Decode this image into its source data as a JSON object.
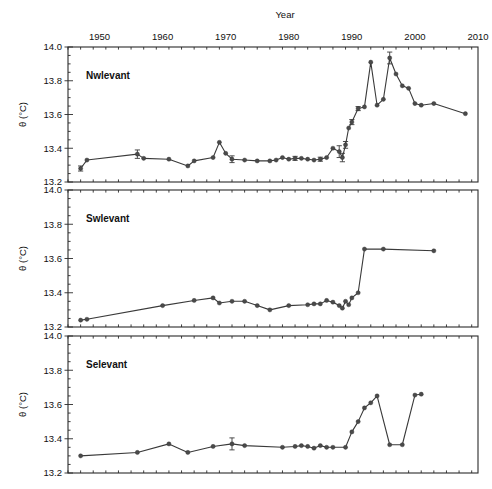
{
  "figure": {
    "title_top": "Year",
    "y_axis_label": "θ (°C)",
    "degree_unit": "°C",
    "background_color": "#ffffff",
    "line_color": "#3a3a3a",
    "marker_color": "#4a4a4a",
    "axis_color": "#2b2b2b"
  },
  "x_axis": {
    "label": "Year",
    "position": "top",
    "min": 1945,
    "max": 2010,
    "major_ticks": [
      1950,
      1960,
      1970,
      1980,
      1990,
      2000,
      2010
    ],
    "tick_labels": [
      "1950",
      "1960",
      "1970",
      "1980",
      "1990",
      "2000",
      "2010"
    ],
    "minor_tick_step": 2
  },
  "y_axis": {
    "label": "θ (°C)",
    "min": 13.2,
    "max": 14.0,
    "major_ticks": [
      13.2,
      13.4,
      13.6,
      13.8,
      14.0
    ],
    "tick_labels": [
      "13.2",
      "13.4",
      "13.6",
      "13.8",
      "14.0"
    ],
    "minor_tick_step": 0.05
  },
  "chart_data": {
    "type": "line",
    "title": "Year",
    "xlabel": "Year",
    "ylabel": "θ (°C)",
    "xlim": [
      1945,
      2010
    ],
    "ylim": [
      13.2,
      14.0
    ],
    "grid": false,
    "legend": "none",
    "panels": [
      {
        "label": "Nwlevant",
        "ylabel": "θ (°C)",
        "ylim": [
          13.2,
          14.0
        ],
        "yticks": [
          13.2,
          13.4,
          13.6,
          13.8,
          14.0
        ],
        "x": [
          1947,
          1948,
          1956,
          1957,
          1961,
          1964,
          1965,
          1968,
          1969,
          1970,
          1971,
          1973,
          1975,
          1977,
          1978,
          1979,
          1980,
          1981,
          1982,
          1983,
          1984,
          1985,
          1986,
          1987,
          1988,
          1988.5,
          1989,
          1989.5,
          1990,
          1991,
          1992,
          1993,
          1994,
          1995,
          1996,
          1997,
          1998,
          1999,
          2000,
          2001,
          2003,
          2008
        ],
        "y": [
          13.28,
          13.33,
          13.365,
          13.34,
          13.335,
          13.295,
          13.325,
          13.345,
          13.435,
          13.37,
          13.335,
          13.33,
          13.325,
          13.325,
          13.33,
          13.345,
          13.335,
          13.34,
          13.34,
          13.335,
          13.33,
          13.335,
          13.345,
          13.4,
          13.38,
          13.345,
          13.42,
          13.52,
          13.555,
          13.635,
          13.645,
          13.91,
          13.655,
          13.69,
          13.935,
          13.84,
          13.77,
          13.755,
          13.665,
          13.655,
          13.665,
          13.605
        ],
        "errors": [
          {
            "x": 1947,
            "y": 13.28,
            "err": 0.015
          },
          {
            "x": 1956,
            "y": 13.365,
            "err": 0.025
          },
          {
            "x": 1971,
            "y": 13.335,
            "err": 0.02
          },
          {
            "x": 1981,
            "y": 13.34,
            "err": 0.012
          },
          {
            "x": 1985,
            "y": 13.335,
            "err": 0.012
          },
          {
            "x": 1988,
            "y": 13.38,
            "err": 0.035
          },
          {
            "x": 1988.5,
            "y": 13.345,
            "err": 0.025
          },
          {
            "x": 1989,
            "y": 13.42,
            "err": 0.02
          },
          {
            "x": 1990,
            "y": 13.555,
            "err": 0.015
          },
          {
            "x": 1991,
            "y": 13.635,
            "err": 0.012
          },
          {
            "x": 1996,
            "y": 13.935,
            "err": 0.035
          }
        ]
      },
      {
        "label": "Swlevant",
        "ylabel": "θ (°C)",
        "ylim": [
          13.2,
          14.0
        ],
        "yticks": [
          13.2,
          13.4,
          13.6,
          13.8,
          14.0
        ],
        "x": [
          1947,
          1948,
          1960,
          1965,
          1968,
          1969,
          1971,
          1973,
          1975,
          1977,
          1980,
          1983,
          1984,
          1985,
          1986,
          1987,
          1988,
          1988.5,
          1989,
          1989.5,
          1990,
          1991,
          1992,
          1995,
          2003
        ],
        "y": [
          13.24,
          13.245,
          13.325,
          13.355,
          13.37,
          13.34,
          13.35,
          13.35,
          13.325,
          13.3,
          13.325,
          13.33,
          13.335,
          13.335,
          13.355,
          13.345,
          13.325,
          13.31,
          13.35,
          13.33,
          13.37,
          13.4,
          13.655,
          13.655,
          13.645
        ],
        "errors": []
      },
      {
        "label": "Selevant",
        "ylabel": "θ (°C)",
        "ylim": [
          13.2,
          14.0
        ],
        "yticks": [
          13.2,
          13.4,
          13.6,
          13.8,
          14.0
        ],
        "x": [
          1947,
          1956,
          1961,
          1964,
          1968,
          1971,
          1973,
          1979,
          1981,
          1982,
          1983,
          1984,
          1985,
          1986,
          1987,
          1989,
          1990,
          1991,
          1992,
          1993,
          1994,
          1996,
          1998,
          2000,
          2001
        ],
        "y": [
          13.3,
          13.32,
          13.37,
          13.32,
          13.355,
          13.37,
          13.36,
          13.35,
          13.355,
          13.36,
          13.355,
          13.345,
          13.36,
          13.35,
          13.35,
          13.35,
          13.44,
          13.5,
          13.58,
          13.61,
          13.65,
          13.365,
          13.365,
          13.655,
          13.66
        ],
        "errors": [
          {
            "x": 1971,
            "y": 13.37,
            "err": 0.035
          }
        ]
      }
    ]
  }
}
